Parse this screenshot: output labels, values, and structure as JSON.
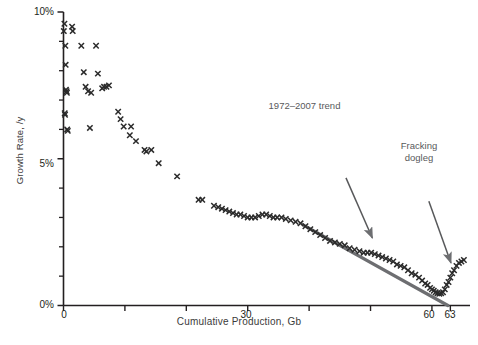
{
  "chart_data": {
    "type": "scatter",
    "title": "",
    "xlabel": "Cumulative Production, Gb",
    "ylabel": "Growth Rate, /y",
    "xlim": [
      0,
      66.2
    ],
    "ylim": [
      0,
      10
    ],
    "grid": false,
    "legend": "none",
    "y_tick_labels": [
      "0%",
      "5%",
      "10%"
    ],
    "y_tick_values": [
      0,
      5,
      10
    ],
    "y_minor_tick_values": [
      1,
      2,
      3,
      4,
      6,
      7,
      8,
      9
    ],
    "x_tick_labels": [
      "0",
      "30",
      "60",
      "63"
    ],
    "x_tick_values": [
      0,
      30,
      60,
      63
    ],
    "x_minor_tick_values": [
      10,
      20,
      40,
      50
    ],
    "marker": "x",
    "marker_color": "#2b2b2b",
    "series": [
      {
        "name": "Oil growth rate vs cumulative production",
        "points": [
          [
            0.05,
            9.35
          ],
          [
            0.15,
            9.6
          ],
          [
            0.2,
            6.55
          ],
          [
            0.25,
            6.5
          ],
          [
            0.3,
            8.85
          ],
          [
            0.35,
            8.2
          ],
          [
            0.4,
            7.35
          ],
          [
            0.5,
            7.3
          ],
          [
            0.55,
            7.25
          ],
          [
            0.6,
            6.0
          ],
          [
            0.7,
            5.95
          ],
          [
            1.4,
            9.5
          ],
          [
            1.5,
            9.35
          ],
          [
            2.9,
            8.85
          ],
          [
            3.3,
            7.95
          ],
          [
            3.6,
            7.45
          ],
          [
            4.0,
            7.3
          ],
          [
            4.5,
            7.25
          ],
          [
            4.3,
            6.05
          ],
          [
            5.3,
            8.85
          ],
          [
            5.6,
            7.9
          ],
          [
            6.3,
            7.4
          ],
          [
            6.6,
            7.45
          ],
          [
            7.0,
            7.45
          ],
          [
            7.4,
            7.5
          ],
          [
            8.9,
            6.6
          ],
          [
            9.3,
            6.35
          ],
          [
            9.8,
            6.1
          ],
          [
            10.8,
            5.8
          ],
          [
            11.0,
            6.1
          ],
          [
            11.8,
            5.6
          ],
          [
            13.2,
            5.3
          ],
          [
            13.5,
            5.25
          ],
          [
            14.3,
            5.3
          ],
          [
            15.5,
            4.85
          ],
          [
            18.5,
            4.4
          ],
          [
            22.0,
            3.6
          ],
          [
            22.6,
            3.6
          ],
          [
            24.5,
            3.4
          ],
          [
            25.2,
            3.35
          ],
          [
            25.8,
            3.3
          ],
          [
            26.4,
            3.25
          ],
          [
            27.0,
            3.2
          ],
          [
            27.6,
            3.15
          ],
          [
            28.2,
            3.1
          ],
          [
            28.8,
            3.1
          ],
          [
            29.4,
            3.05
          ],
          [
            30.0,
            3.0
          ],
          [
            30.6,
            3.0
          ],
          [
            31.2,
            3.0
          ],
          [
            31.8,
            3.05
          ],
          [
            32.4,
            3.1
          ],
          [
            33.0,
            3.1
          ],
          [
            33.6,
            3.05
          ],
          [
            34.2,
            3.0
          ],
          [
            34.8,
            3.0
          ],
          [
            35.5,
            3.0
          ],
          [
            36.2,
            2.95
          ],
          [
            37.0,
            2.9
          ],
          [
            37.8,
            2.85
          ],
          [
            38.6,
            2.8
          ],
          [
            39.4,
            2.7
          ],
          [
            40.2,
            2.6
          ],
          [
            41.0,
            2.5
          ],
          [
            41.8,
            2.4
          ],
          [
            42.6,
            2.3
          ],
          [
            43.4,
            2.2
          ],
          [
            44.2,
            2.15
          ],
          [
            45.0,
            2.1
          ],
          [
            45.8,
            2.05
          ],
          [
            46.6,
            1.95
          ],
          [
            47.4,
            1.9
          ],
          [
            48.2,
            1.85
          ],
          [
            48.9,
            1.8
          ],
          [
            49.5,
            1.8
          ],
          [
            50.1,
            1.8
          ],
          [
            50.7,
            1.75
          ],
          [
            51.3,
            1.7
          ],
          [
            51.9,
            1.65
          ],
          [
            52.5,
            1.6
          ],
          [
            53.1,
            1.55
          ],
          [
            53.7,
            1.5
          ],
          [
            54.3,
            1.4
          ],
          [
            54.9,
            1.35
          ],
          [
            55.5,
            1.3
          ],
          [
            56.1,
            1.2
          ],
          [
            56.7,
            1.1
          ],
          [
            57.3,
            1.05
          ],
          [
            57.9,
            0.95
          ],
          [
            58.4,
            0.85
          ],
          [
            58.9,
            0.75
          ],
          [
            59.3,
            0.7
          ],
          [
            59.7,
            0.6
          ],
          [
            60.0,
            0.55
          ],
          [
            60.3,
            0.5
          ],
          [
            60.6,
            0.45
          ],
          [
            60.9,
            0.42
          ],
          [
            61.2,
            0.4
          ],
          [
            61.5,
            0.42
          ],
          [
            61.8,
            0.45
          ],
          [
            62.1,
            0.55
          ],
          [
            62.4,
            0.7
          ],
          [
            62.7,
            0.8
          ],
          [
            63.0,
            0.95
          ],
          [
            63.3,
            1.1
          ],
          [
            63.6,
            1.2
          ],
          [
            64.0,
            1.35
          ],
          [
            64.4,
            1.45
          ],
          [
            64.8,
            1.5
          ],
          [
            65.2,
            1.55
          ]
        ]
      }
    ],
    "trend_line": {
      "label": "1972-2007 trend",
      "color": "#6d6e71",
      "x_start": 39.0,
      "y_start": 2.75,
      "x_end": 62.6,
      "y_end": 0.0
    },
    "annotations": [
      {
        "name": "trend-annotation",
        "text": "1972–2007 trend",
        "color": "#58595b",
        "arrow_from": [
          46.0,
          4.35
        ],
        "arrow_to": [
          50.3,
          2.3
        ]
      },
      {
        "name": "fracking-dogleg-annotation",
        "text_line1": "Fracking",
        "text_line2": "dogleg",
        "color": "#58595b",
        "arrow_from": [
          59.5,
          3.55
        ],
        "arrow_to": [
          63.1,
          1.45
        ]
      }
    ]
  },
  "axes": {
    "y_label": "Growth Rate, /y",
    "x_label": "Cumulative Production, Gb",
    "y_ticks": [
      {
        "label": "10%"
      },
      {
        "label": "5%"
      },
      {
        "label": "0%"
      }
    ],
    "x_ticks": [
      {
        "label": "0"
      },
      {
        "label": "30"
      },
      {
        "label": "60"
      },
      {
        "label": "63"
      }
    ]
  },
  "annotations": {
    "trend": "1972–2007 trend",
    "fracking_line1": "Fracking",
    "fracking_line2": "dogleg"
  }
}
